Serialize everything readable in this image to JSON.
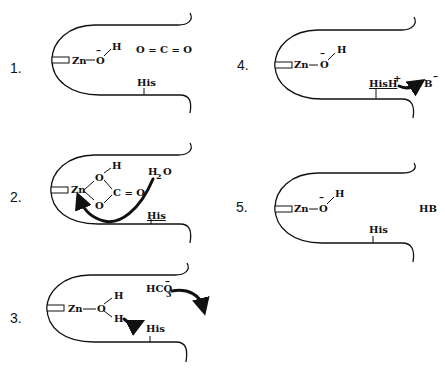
{
  "diagram": {
    "colors": {
      "ink": "#111111",
      "background": "#ffffff"
    },
    "panels": [
      {
        "step": "1.",
        "metal": "Zn",
        "ligand_O": "O",
        "O_charge": "–",
        "ligand_H": "H",
        "substrate": "O = C = O",
        "residue": "His"
      },
      {
        "step": "2.",
        "metal": "Zn",
        "O_top": "O",
        "H_top": "H",
        "O_bottom": "O",
        "carbonyl": "C = O",
        "water": "H",
        "water_sub": "2",
        "water_O": "O",
        "residue": "His"
      },
      {
        "step": "3.",
        "metal": "Zn",
        "ligand_O": "O",
        "H_top": "H",
        "H_bottom": "H",
        "product": "HCO",
        "product_sub": "3",
        "product_charge": "–",
        "residue": "His"
      },
      {
        "step": "4.",
        "metal": "Zn",
        "ligand_O": "O",
        "O_charge": "–",
        "ligand_H": "H",
        "residue": "HisH",
        "residue_charge": "+",
        "base": "B",
        "base_charge": "–"
      },
      {
        "step": "5.",
        "metal": "Zn",
        "ligand_O": "O",
        "O_charge": "–",
        "ligand_H": "H",
        "conjugate_acid": "HB",
        "residue": "His"
      }
    ]
  }
}
